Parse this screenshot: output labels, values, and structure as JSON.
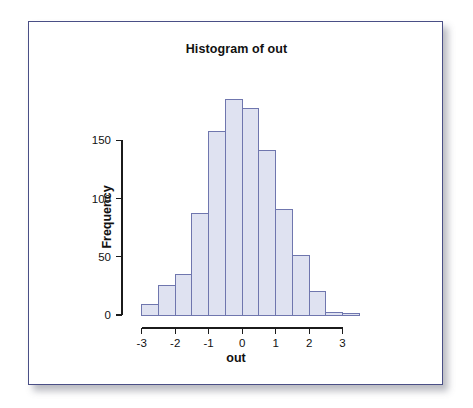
{
  "figure": {
    "title": "Histogram of out",
    "xlabel": "out",
    "ylabel": "Frequency"
  },
  "colors": {
    "bar_fill": "#dfe2f1",
    "bar_border": "#6f76ae",
    "axis": "#1b1b1b",
    "frame_border": "#4a4f86",
    "background": "#ffffff"
  },
  "chart_data": {
    "type": "bar",
    "title": "Histogram of out",
    "xlabel": "out",
    "ylabel": "Frequency",
    "xlim": [
      -3.2,
      3.7
    ],
    "ylim": [
      0,
      195
    ],
    "grid": false,
    "legend": null,
    "bin_width": 0.5,
    "bin_edges": [
      -3.0,
      -2.5,
      -2.0,
      -1.5,
      -1.0,
      -0.5,
      0.0,
      0.5,
      1.0,
      1.5,
      2.0,
      2.5,
      3.0,
      3.5
    ],
    "categories": [
      "-3.0 to -2.5",
      "-2.5 to -2.0",
      "-2.0 to -1.5",
      "-1.5 to -1.0",
      "-1.0 to -0.5",
      "-0.5 to 0.0",
      "0.0 to 0.5",
      "0.5 to 1.0",
      "1.0 to 1.5",
      "1.5 to 2.0",
      "2.0 to 2.5",
      "2.5 to 3.0",
      "3.0 to 3.5"
    ],
    "values": [
      9,
      25,
      35,
      87,
      158,
      185,
      177,
      141,
      91,
      51,
      20,
      2,
      1
    ],
    "xticks": [
      -3,
      -2,
      -1,
      0,
      1,
      2,
      3
    ],
    "xtick_labels": [
      "-3",
      "-2",
      "-1",
      "0",
      "1",
      "2",
      "3"
    ],
    "yticks": [
      0,
      50,
      100,
      150
    ],
    "ytick_labels": [
      "0",
      "50",
      "100",
      "150"
    ]
  }
}
